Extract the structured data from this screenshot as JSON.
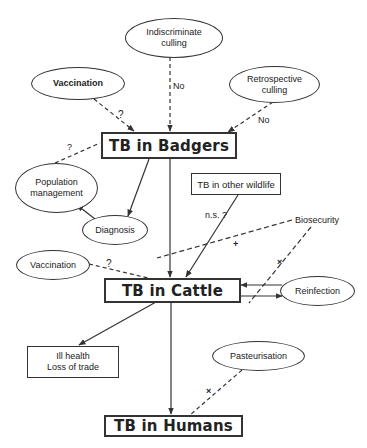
{
  "diagram": {
    "nodes": {
      "indiscriminate_culling": {
        "label": "Indiscriminate\nculling",
        "shape": "ellipse"
      },
      "vaccination_badgers": {
        "label": "Vaccination",
        "shape": "ellipse"
      },
      "retrospective_culling": {
        "label": "Retrospective\nculling",
        "shape": "ellipse"
      },
      "tb_badgers": {
        "label": "TB in Badgers",
        "shape": "box"
      },
      "population_management": {
        "label": "Population\nmanagement",
        "shape": "ellipse"
      },
      "diagnosis": {
        "label": "Diagnosis",
        "shape": "ellipse"
      },
      "tb_other_wildlife": {
        "label": "TB in other wildlife",
        "shape": "box"
      },
      "biosecurity": {
        "label": "Biosecurity",
        "shape": "text"
      },
      "vaccination_cattle": {
        "label": "Vaccination",
        "shape": "ellipse"
      },
      "tb_cattle": {
        "label": "TB in Cattle",
        "shape": "box"
      },
      "reinfection": {
        "label": "Reinfection",
        "shape": "ellipse"
      },
      "ill_health": {
        "label": "Ill health\nLoss of trade",
        "shape": "box"
      },
      "pasteurisation": {
        "label": "Pasteurisation",
        "shape": "ellipse"
      },
      "tb_humans": {
        "label": "TB in Humans",
        "shape": "box"
      }
    },
    "edge_labels": {
      "indiscriminate_no": "No",
      "retrospective_no": "No",
      "vaccination_badgers_q": "?",
      "popmgmt_q": "?",
      "wildlife_ns": "n.s. ?",
      "biosecurity_plus": "+",
      "biosecurity_x": "×",
      "vaccination_cattle_q": "?",
      "pasteurisation_x": "×"
    }
  }
}
